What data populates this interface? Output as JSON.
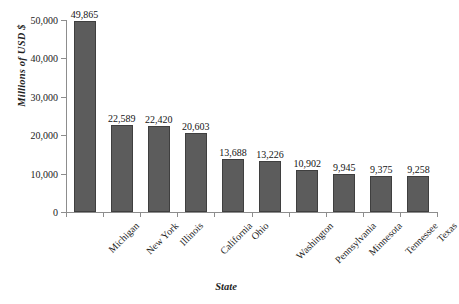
{
  "chart_data": {
    "type": "bar",
    "title": "",
    "xlabel": "State",
    "ylabel": "Millions of USD $",
    "categories": [
      "Michigan",
      "New York",
      "Illinois",
      "California",
      "Ohio",
      "Washington",
      "Pennsylvania",
      "Minnesota",
      "Tennessee",
      "Texas"
    ],
    "values": [
      49865,
      22589,
      22420,
      20603,
      13688,
      13226,
      10902,
      9945,
      9375,
      9258
    ],
    "value_labels": [
      "49,865",
      "22,589",
      "22,420",
      "20,603",
      "13,688",
      "13,226",
      "10,902",
      "9,945",
      "9,375",
      "9,258"
    ],
    "ylim": [
      0,
      50000
    ],
    "yticks": [
      0,
      10000,
      20000,
      30000,
      40000,
      50000
    ],
    "ytick_labels": [
      "0",
      "10,000",
      "20,000",
      "30,000",
      "40,000",
      "50,000"
    ],
    "grid": false,
    "legend": "none",
    "bar_color": "#5c5c5c",
    "bar_edge_color": "#3f3f3f",
    "axis_color": "#8d8d8d",
    "background": "#ffffff"
  }
}
